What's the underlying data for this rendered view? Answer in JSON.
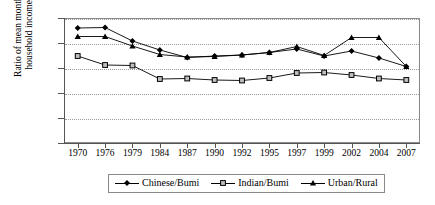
{
  "chart_data": {
    "type": "line",
    "title": "",
    "xlabel": "",
    "ylabel": "Ratio of mean monthly household incomes",
    "ylabel_line1": "Ratio of mean monthly",
    "ylabel_line2": "household incomes",
    "categories": [
      "1970",
      "1976",
      "1979",
      "1984",
      "1987",
      "1990",
      "1992",
      "1995",
      "1997",
      "1999",
      "2002",
      "2004",
      "2007"
    ],
    "ylim": [
      0,
      2.5
    ],
    "yticks": [
      "0",
      "0.5",
      "1",
      "1.5",
      "2",
      "2.5"
    ],
    "ytick_values": [
      0,
      0.5,
      1,
      1.5,
      2,
      2.5
    ],
    "grid": true,
    "legend_position": "bottom",
    "series": [
      {
        "name": "Chinese/Bumi",
        "marker": "diamond",
        "color": "#000000",
        "values": [
          2.3,
          2.31,
          2.04,
          1.86,
          1.71,
          1.74,
          1.76,
          1.81,
          1.88,
          1.74,
          1.84,
          1.7,
          1.53
        ]
      },
      {
        "name": "Indian/Bumi",
        "marker": "square",
        "color": "#000000",
        "values": [
          1.74,
          1.56,
          1.55,
          1.28,
          1.29,
          1.26,
          1.25,
          1.3,
          1.4,
          1.41,
          1.36,
          1.29,
          1.26
        ]
      },
      {
        "name": "Urban/Rural",
        "marker": "triangle",
        "color": "#000000",
        "values": [
          2.13,
          2.13,
          1.94,
          1.77,
          1.72,
          1.73,
          1.76,
          1.81,
          1.93,
          1.75,
          2.11,
          2.11,
          1.53
        ]
      }
    ]
  },
  "legend": {
    "items": [
      {
        "label": "Chinese/Bumi",
        "marker": "diamond"
      },
      {
        "label": "Indian/Bumi",
        "marker": "square"
      },
      {
        "label": "Urban/Rural",
        "marker": "triangle"
      }
    ]
  }
}
